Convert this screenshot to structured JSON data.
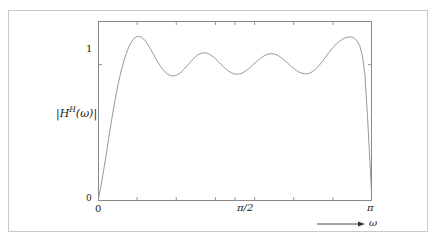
{
  "figure": {
    "background": "#ffffff",
    "border_color": "#c9c9c9",
    "axis_color": "#8a8a8a",
    "curve_color": "#8c8c8c"
  },
  "axes": {
    "y_label_text": "|H",
    "y_label_sup": "H",
    "y_label_tail": "(ω)|",
    "y_ticks": [
      "1",
      "0"
    ],
    "x_ticks": [
      "0",
      "π/2",
      "π"
    ],
    "x_axis_variable": "ω",
    "arrow_icon": "right-arrow"
  },
  "chart_data": {
    "type": "line",
    "title": "",
    "xlabel": "ω",
    "ylabel": "|H^H(ω)|",
    "xlim": [
      0,
      3.14159
    ],
    "ylim": [
      0,
      1.32
    ],
    "xtick_values": [
      0,
      1.5708,
      3.14159
    ],
    "xtick_labels": [
      "0",
      "π/2",
      "π"
    ],
    "ytick_values": [
      0,
      1
    ],
    "ytick_labels": [
      "0",
      "1"
    ],
    "minor_xtick_values": [
      0.4488,
      0.8976,
      1.3464,
      1.7952,
      2.244,
      2.6928
    ],
    "grid": false,
    "legend": null,
    "series": [
      {
        "name": "|H^H(ω)|",
        "color": "#8c8c8c",
        "x": [
          0.0,
          0.03,
          0.06,
          0.09,
          0.12,
          0.15,
          0.18,
          0.21,
          0.24,
          0.27,
          0.3,
          0.33,
          0.36,
          0.39,
          0.42,
          0.45,
          0.48,
          0.51,
          0.54,
          0.57,
          0.6,
          0.63,
          0.66,
          0.69,
          0.72,
          0.75,
          0.78,
          0.81,
          0.84,
          0.87,
          0.9,
          0.93,
          0.96,
          0.99,
          1.02,
          1.05,
          1.08,
          1.11,
          1.14,
          1.17,
          1.2,
          1.23,
          1.26,
          1.29,
          1.32,
          1.35,
          1.38,
          1.41,
          1.44,
          1.47,
          1.5,
          1.53,
          1.56,
          1.59,
          1.62,
          1.65,
          1.68,
          1.71,
          1.74,
          1.77,
          1.8,
          1.83,
          1.86,
          1.89,
          1.92,
          1.95,
          1.98,
          2.01,
          2.04,
          2.07,
          2.1,
          2.13,
          2.16,
          2.19,
          2.22,
          2.25,
          2.28,
          2.31,
          2.34,
          2.37,
          2.4,
          2.43,
          2.46,
          2.49,
          2.52,
          2.55,
          2.58,
          2.61,
          2.64,
          2.67,
          2.7,
          2.73,
          2.76,
          2.79,
          2.82,
          2.85,
          2.88,
          2.91,
          2.94,
          2.97,
          3.0,
          3.03,
          3.06,
          3.09,
          3.1416
        ],
        "y": [
          0.0,
          0.095,
          0.205,
          0.325,
          0.45,
          0.57,
          0.685,
          0.79,
          0.885,
          0.965,
          1.035,
          1.092,
          1.139,
          1.174,
          1.197,
          1.208,
          1.207,
          1.196,
          1.176,
          1.149,
          1.117,
          1.083,
          1.048,
          1.015,
          0.985,
          0.96,
          0.94,
          0.926,
          0.918,
          0.917,
          0.922,
          0.933,
          0.949,
          0.968,
          0.99,
          1.012,
          1.033,
          1.053,
          1.069,
          1.08,
          1.086,
          1.087,
          1.082,
          1.072,
          1.058,
          1.041,
          1.022,
          1.002,
          0.983,
          0.966,
          0.951,
          0.94,
          0.933,
          0.93,
          0.932,
          0.938,
          0.948,
          0.961,
          0.977,
          0.994,
          1.012,
          1.029,
          1.045,
          1.059,
          1.07,
          1.077,
          1.08,
          1.079,
          1.074,
          1.065,
          1.052,
          1.037,
          1.02,
          1.002,
          0.985,
          0.969,
          0.955,
          0.944,
          0.937,
          0.933,
          0.934,
          0.939,
          0.949,
          0.964,
          0.983,
          1.005,
          1.03,
          1.056,
          1.082,
          1.107,
          1.13,
          1.15,
          1.167,
          1.181,
          1.192,
          1.199,
          1.203,
          1.202,
          1.194,
          1.176,
          1.14,
          1.07,
          0.93,
          0.62,
          0.0
        ]
      }
    ]
  }
}
